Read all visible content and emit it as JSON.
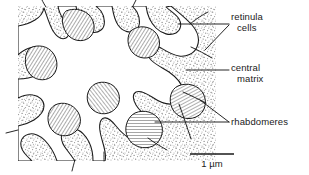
{
  "figure": {
    "labels": [
      {
        "id": "retinula",
        "line1": "retinula",
        "line2": "cells"
      },
      {
        "id": "central",
        "line1": "central",
        "line2": "matrix"
      },
      {
        "id": "rhabdomeres",
        "line1": "rhabdomeres",
        "line2": ""
      }
    ],
    "scalebar": {
      "text": "1 µm",
      "value": "1",
      "unit": "µm"
    },
    "colors": {
      "ink": "#1a1a1a",
      "stipple": "#8a8a8a",
      "hatch": "#6e6e6e",
      "background": "#ffffff"
    }
  }
}
